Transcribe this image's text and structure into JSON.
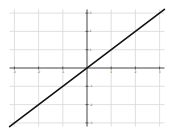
{
  "chart_data": {
    "type": "line",
    "title": "",
    "xlabel": "",
    "ylabel": "",
    "xlim": [
      -3.2,
      3.2
    ],
    "ylim": [
      -3.2,
      3.2
    ],
    "grid": true,
    "legend": null,
    "x_ticks": [
      -3,
      -2,
      -1,
      1,
      2,
      3
    ],
    "y_ticks": [
      3,
      2,
      1,
      -1,
      -2,
      -3
    ],
    "x_tick_labels": [
      "-3",
      "-2",
      "-1",
      "1",
      "2",
      "3"
    ],
    "y_tick_labels": [
      "3",
      "2",
      "1",
      "-1",
      "-2",
      "-3"
    ],
    "series": [
      {
        "name": "y = x",
        "x": [
          -3.2,
          3.2
        ],
        "y": [
          -3.2,
          3.2
        ],
        "color": "#111111"
      }
    ]
  },
  "colors": {
    "grid": "#d8d8d8",
    "axis": "#444444",
    "line": "#111111"
  }
}
